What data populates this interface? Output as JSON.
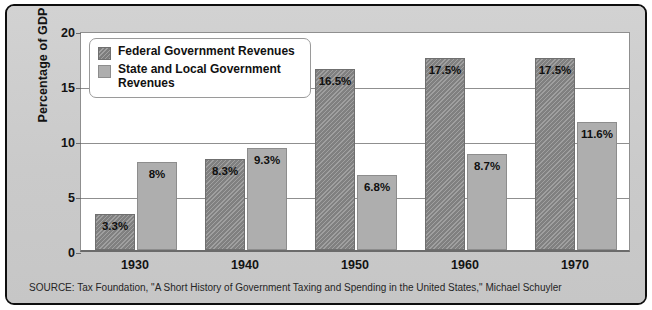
{
  "figure": {
    "source_note": "SOURCE: Tax Foundation, \"A Short History of Government Taxing and Spending in the United States,\" Michael Schuyler",
    "frame_color": "#cfcfcf",
    "border_color": "#0e0e0e"
  },
  "chart_data": {
    "type": "bar",
    "title": "",
    "subtitle": "",
    "xlabel": "",
    "ylabel": "Percentage of GDP",
    "categories": [
      "1930",
      "1940",
      "1950",
      "1960",
      "1970"
    ],
    "yticks": [
      "0",
      "5",
      "10",
      "15",
      "20"
    ],
    "ylim": [
      0,
      20
    ],
    "grid": true,
    "legend_position": "inside-top-left",
    "series": [
      {
        "name": "Federal Government Revenues",
        "color": "#8e8e8e",
        "pattern": "diagonal-hatch",
        "values": [
          3.3,
          8.3,
          16.5,
          17.5,
          17.5
        ],
        "labels": [
          "3.3%",
          "8.3%",
          "16.5%",
          "17.5%",
          "17.5%"
        ]
      },
      {
        "name": "State and Local Government Revenues",
        "color": "#aeaeae",
        "pattern": "solid",
        "values": [
          8.0,
          9.3,
          6.8,
          8.7,
          11.6
        ],
        "labels": [
          "8%",
          "9.3%",
          "6.8%",
          "8.7%",
          "11.6%"
        ]
      }
    ]
  }
}
